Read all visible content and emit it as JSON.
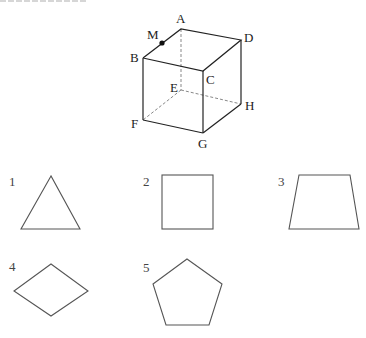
{
  "figure": {
    "cube": {
      "vertices": {
        "A": {
          "label": "A",
          "x": 181,
          "y": 29
        },
        "B": {
          "label": "B",
          "x": 143,
          "y": 58
        },
        "C": {
          "label": "C",
          "x": 203,
          "y": 71
        },
        "D": {
          "label": "D",
          "x": 241,
          "y": 40
        },
        "E": {
          "label": "E",
          "x": 181,
          "y": 90
        },
        "F": {
          "label": "F",
          "x": 143,
          "y": 120
        },
        "G": {
          "label": "G",
          "x": 203,
          "y": 133
        },
        "H": {
          "label": "H",
          "x": 241,
          "y": 104
        }
      },
      "point_M": {
        "label": "M",
        "x": 162,
        "y": 43
      }
    }
  },
  "options": [
    {
      "number": "1",
      "shape": "triangle"
    },
    {
      "number": "2",
      "shape": "square"
    },
    {
      "number": "3",
      "shape": "trapezoid"
    },
    {
      "number": "4",
      "shape": "rhombus"
    },
    {
      "number": "5",
      "shape": "pentagon"
    }
  ]
}
